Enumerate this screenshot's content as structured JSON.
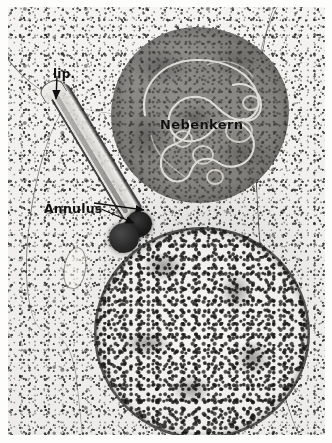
{
  "figure": {
    "kind": "transmission-electron-micrograph",
    "background_tone": "#efeeec",
    "ink_color": "#121212"
  },
  "labels": {
    "lip": "lip.",
    "annulus": "Annulus",
    "nebenkern": "Nebenkern"
  },
  "structures": {
    "nebenkern": {
      "name": "Nebenkern",
      "fill_color": "#827f7c",
      "outline_color": "#5a5855"
    },
    "nucleus": {
      "name": "nucleus",
      "fill_color": "#f1efed",
      "envelope_color": "#1d1d1d"
    },
    "axoneme": {
      "name": "axoneme",
      "wall_color": "#282828",
      "lumen_color": "#e8e7e4"
    },
    "annulus_bodies": {
      "name": "annulus",
      "fill_color": "#1d1d1d"
    },
    "vesicle": {
      "name": "cytoplasmic vesicle",
      "outline_color": "#4b4b4b"
    },
    "plasma_membranes": {
      "name": "plasma membrane outlines",
      "color": "#3a3a3a"
    }
  }
}
